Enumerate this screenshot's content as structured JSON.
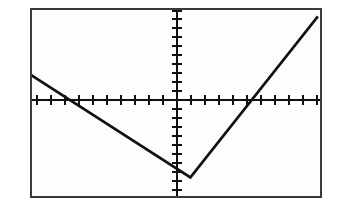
{
  "screen": {
    "title": "Graphing Calculator Screen",
    "width": 337,
    "height": 206,
    "background_color": "#ffffff",
    "frame_color": "#3a3a3a",
    "plot_background_color": "#fdfdfd",
    "ink_color": "#111111"
  },
  "chart_data": {
    "type": "line",
    "title": "",
    "subtitle": "",
    "xlabel": "",
    "ylabel": "",
    "xlim": [
      -10,
      10
    ],
    "ylim": [
      -10,
      10
    ],
    "grid": false,
    "legend": "none",
    "x_tick_count_left": 10,
    "x_tick_count_right": 10,
    "y_tick_count_above": 10,
    "y_tick_count_below": 10,
    "x_tick_step": 1,
    "y_tick_step": 1,
    "axes_drawn": true,
    "tick_marks_drawn": true,
    "axis_labels_shown": false,
    "tick_labels_shown": false,
    "annotations": [],
    "series": [
      {
        "name": "absolute-value-function",
        "shape": "v-shape",
        "vertex": [
          1.0,
          -8.0
        ],
        "left_slope": -4.5,
        "right_slope": 4.5,
        "x_intercepts": [
          -2.8,
          4.8
        ],
        "x": [
          -10.0,
          1.0,
          9.8
        ],
        "y": [
          2.95,
          -8.0,
          9.2
        ],
        "drawn_x": [
          -10.0,
          1.0,
          9.8
        ],
        "drawn_y": [
          2.95,
          -8.0,
          9.2
        ]
      }
    ]
  },
  "icons": {
    "plot_region": "line-plot-icon"
  }
}
